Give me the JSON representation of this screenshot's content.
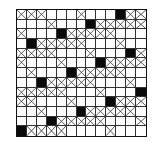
{
  "diagram": {
    "type": "grid-pattern",
    "rows": 13,
    "cols": 13,
    "legend": {
      ".": "empty",
      "X": "crossed",
      "#": "filled"
    },
    "cells": [
      "XXX...X...#XX",
      "...X...#XXXXX",
      "X...#XXXXX...",
      ".#XXXXX...X..",
      "XXXX...X...#X",
      "X...X...#XXXX",
      ".X...#XXXXX..",
      "..#XXXXX...X.",
      "XXXXX...X...#",
      "XX...X...#XXX",
      "..X...#XXXXX.",
      "...#XXXXX...X",
      "#XXXX....X..."
    ],
    "colors": {
      "line": "#333333",
      "filled": "#0a0a0a",
      "background": "#ffffff"
    }
  }
}
